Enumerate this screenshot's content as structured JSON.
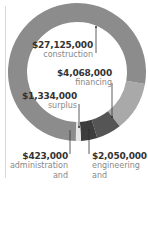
{
  "chart_data": {
    "type": "pie",
    "style": "donut",
    "title": "",
    "segments": [
      {
        "label": "construction",
        "value": 27125000,
        "display": "$27,125,000",
        "color": "#8c8c8c"
      },
      {
        "label": "financing",
        "value": 4068000,
        "display": "$4,068,000",
        "color": "#a9a9a9"
      },
      {
        "label": "engineering and inspection",
        "value": 2050000,
        "display": "$2,050,000",
        "color": "#555555"
      },
      {
        "label": "surplus",
        "value": 1334000,
        "display": "$1,334,000",
        "color": "#3d3d3d"
      },
      {
        "label": "administration and preliminaries",
        "value": 423000,
        "display": "$423,000",
        "color": "#e6e6e6"
      }
    ],
    "total": 35000000
  },
  "labels": {
    "construction": {
      "value": "$27,125,000",
      "name": "construction"
    },
    "financing": {
      "value": "$4,068,000",
      "name": "financing"
    },
    "surplus": {
      "value": "$1,334,000",
      "name": "surplus"
    },
    "admin": {
      "value": "$423,000",
      "line1": "administration",
      "line2": "and preliminaries"
    },
    "engineering": {
      "value": "$2,050,000",
      "line1": "engineering",
      "line2": "and inspection"
    }
  }
}
